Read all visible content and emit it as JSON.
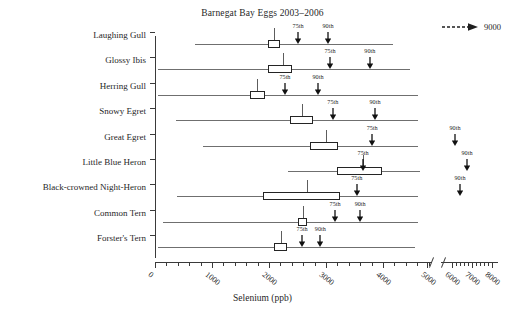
{
  "chart_data": {
    "type": "bar",
    "title": "Barnegat Bay Eggs 2003–2006",
    "xlabel": "Selenium (ppb)",
    "ylabel": "",
    "xlim": [
      0,
      8000
    ],
    "grid": false,
    "axis_break": {
      "from": 5000,
      "to": 6000,
      "label": "axis-break"
    },
    "xticks": [
      0,
      1000,
      2000,
      3000,
      4000,
      5000,
      6000,
      7000,
      8000
    ],
    "xtick_labels": [
      "0",
      "1000",
      "2000",
      "3000",
      "4000",
      "5000",
      "6000",
      "7000",
      "8000"
    ],
    "minor_tick_interval": 200,
    "legend": {
      "position": "top-right",
      "label": "9000",
      "marker": "dashed-arrow-right-icon"
    },
    "annotation_labels": {
      "p75": "75th",
      "p90": "90th"
    },
    "categories": [
      "Laughing Gull",
      "Glossy Ibis",
      "Herring Gull",
      "Snowy Egret",
      "Great Egret",
      "Little Blue Heron",
      "Black-crowned Night-Heron",
      "Common Tern",
      "Forster's Tern"
    ],
    "series": [
      {
        "name": "Laughing Gull",
        "whisker_low": 700,
        "whisker_high": 4180,
        "box_low": 1980,
        "box_high": 2190,
        "median": 2090,
        "p75": 2510,
        "p90": 3035
      },
      {
        "name": "Glossy Ibis",
        "whisker_low": 60,
        "whisker_high": 4480,
        "box_low": 1980,
        "box_high": 2400,
        "median": 2250,
        "p75": 3070,
        "p90": 3770
      },
      {
        "name": "Herring Gull",
        "whisker_low": 60,
        "whisker_high": 4610,
        "box_low": 1670,
        "box_high": 1930,
        "median": 1790,
        "p75": 2280,
        "p90": 2860
      },
      {
        "name": "Snowy Egret",
        "whisker_low": 360,
        "whisker_high": 4610,
        "box_low": 2370,
        "box_high": 2770,
        "median": 2580,
        "p75": 3120,
        "p90": 3860
      },
      {
        "name": "Great Egret",
        "whisker_low": 840,
        "whisker_high": 4610,
        "box_low": 2720,
        "box_high": 3210,
        "median": 3000,
        "p75": 3810,
        "p90": 6150
      },
      {
        "name": "Little Blue Heron",
        "whisker_low": 2330,
        "whisker_high": 4650,
        "box_low": 3190,
        "box_high": 3980,
        "median": 3650,
        "p75": 3650,
        "p90": 6750
      },
      {
        "name": "Black-crowned Night-Heron",
        "whisker_low": 390,
        "whisker_high": 4610,
        "box_low": 1890,
        "box_high": 3240,
        "median": 2660,
        "p75": 3540,
        "p90": 6400
      },
      {
        "name": "Common Tern",
        "whisker_low": 140,
        "whisker_high": 4610,
        "box_low": 2510,
        "box_high": 2670,
        "median": 2600,
        "p75": 3160,
        "p90": 3600
      },
      {
        "name": "Forster's Tern",
        "whisker_low": 60,
        "whisker_high": 4560,
        "box_low": 2090,
        "box_high": 2320,
        "median": 2210,
        "p75": 2580,
        "p90": 2900
      }
    ]
  }
}
